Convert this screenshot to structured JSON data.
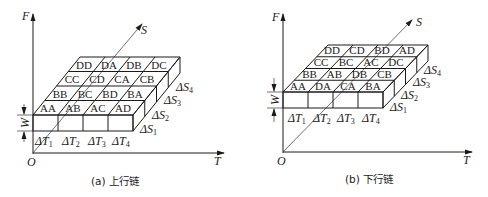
{
  "figures": [
    {
      "id": "a",
      "caption": "(a) 上行链",
      "axes": {
        "vertical": "F",
        "horizontal": "T",
        "diagonal": "S",
        "origin": "O"
      },
      "height_label": "W",
      "time_labels": [
        "ΔT",
        "ΔT",
        "ΔT",
        "ΔT"
      ],
      "time_subs": [
        "1",
        "2",
        "3",
        "4"
      ],
      "space_labels": [
        "ΔS",
        "ΔS",
        "ΔS",
        "ΔS"
      ],
      "space_subs": [
        "1",
        "2",
        "3",
        "4"
      ],
      "rows": [
        [
          "AA",
          "AB",
          "AC",
          "AD"
        ],
        [
          "BB",
          "BC",
          "BD",
          "BA"
        ],
        [
          "CC",
          "CD",
          "CA",
          "CB"
        ],
        [
          "DD",
          "DA",
          "DB",
          "DC"
        ]
      ]
    },
    {
      "id": "b",
      "caption": "(b) 下行链",
      "axes": {
        "vertical": "F",
        "horizontal": "T",
        "diagonal": "S",
        "origin": "O"
      },
      "height_label": "W",
      "time_labels": [
        "ΔT",
        "ΔT",
        "ΔT",
        "ΔT"
      ],
      "time_subs": [
        "1",
        "2",
        "3",
        "4"
      ],
      "space_labels": [
        "ΔS",
        "ΔS",
        "ΔS",
        "ΔS"
      ],
      "space_subs": [
        "1",
        "2",
        "3",
        "4"
      ],
      "rows": [
        [
          "AA",
          "DA",
          "CA",
          "BA"
        ],
        [
          "BB",
          "AB",
          "DB",
          "CB"
        ],
        [
          "CC",
          "BC",
          "AC",
          "DC"
        ],
        [
          "DD",
          "CD",
          "BD",
          "AD"
        ]
      ]
    }
  ]
}
